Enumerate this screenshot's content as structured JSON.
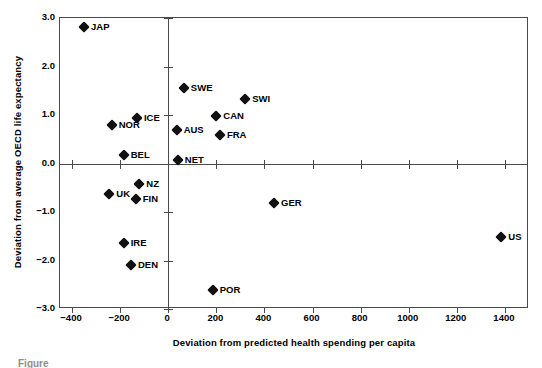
{
  "chart_data": {
    "type": "scatter",
    "title": "",
    "xlabel": "Deviation from predicted health spending per capita",
    "ylabel": "Deviation from average OECD life expectancy",
    "xlim": [
      -450,
      1500
    ],
    "ylim": [
      -3.0,
      3.0
    ],
    "grid": false,
    "legend": "none",
    "xticks": [
      -400,
      -200,
      0,
      200,
      400,
      600,
      800,
      1000,
      1200,
      1400
    ],
    "xtick_labels": [
      "−400",
      "−200",
      "0",
      "200",
      "400",
      "600",
      "800",
      "1000",
      "1200",
      "1400"
    ],
    "yticks": [
      3.0,
      2.0,
      1.0,
      0.0,
      -1.0,
      -2.0,
      -3.0
    ],
    "ytick_labels": [
      "3.0",
      "2.0",
      "1.0",
      "0.0",
      "−1.0",
      "−2.0",
      "−3.0"
    ],
    "points": [
      {
        "label": "JAP",
        "x": -350,
        "y": 2.82,
        "label_pos": "right"
      },
      {
        "label": "SWE",
        "x": 65,
        "y": 1.55,
        "label_pos": "right"
      },
      {
        "label": "SWI",
        "x": 320,
        "y": 1.33,
        "label_pos": "right"
      },
      {
        "label": "ICE",
        "x": -130,
        "y": 0.93,
        "label_pos": "right"
      },
      {
        "label": "CAN",
        "x": 200,
        "y": 0.98,
        "label_pos": "right"
      },
      {
        "label": "NOR",
        "x": -235,
        "y": 0.8,
        "label_pos": "right"
      },
      {
        "label": "AUS",
        "x": 35,
        "y": 0.69,
        "label_pos": "right"
      },
      {
        "label": "FRA",
        "x": 215,
        "y": 0.58,
        "label_pos": "right"
      },
      {
        "label": "BEL",
        "x": -185,
        "y": 0.17,
        "label_pos": "right"
      },
      {
        "label": "NET",
        "x": 40,
        "y": 0.07,
        "label_pos": "right"
      },
      {
        "label": "NZ",
        "x": -120,
        "y": -0.43,
        "label_pos": "right"
      },
      {
        "label": "UK",
        "x": -245,
        "y": -0.63,
        "label_pos": "right"
      },
      {
        "label": "FIN",
        "x": -135,
        "y": -0.74,
        "label_pos": "right"
      },
      {
        "label": "GER",
        "x": 440,
        "y": -0.82,
        "label_pos": "right"
      },
      {
        "label": "US",
        "x": 1385,
        "y": -1.52,
        "label_pos": "right"
      },
      {
        "label": "IRE",
        "x": -185,
        "y": -1.63,
        "label_pos": "right"
      },
      {
        "label": "DEN",
        "x": -155,
        "y": -2.1,
        "label_pos": "right"
      },
      {
        "label": "POR",
        "x": 185,
        "y": -2.6,
        "label_pos": "right"
      }
    ]
  },
  "caption": "Figure"
}
